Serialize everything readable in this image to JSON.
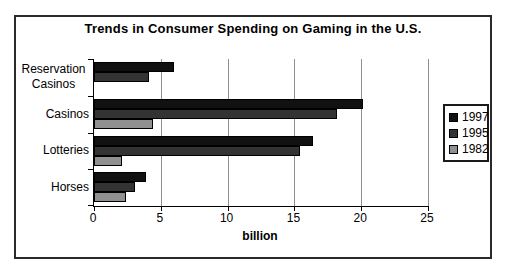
{
  "chart_data": {
    "type": "bar",
    "orientation": "horizontal",
    "title": "Trends in Consumer Spending on Gaming in the U.S.",
    "xlabel": "billion",
    "xlim": [
      0,
      25
    ],
    "xticks": [
      0,
      5,
      10,
      15,
      20,
      25
    ],
    "grid": true,
    "legend_position": "right",
    "categories": [
      "Reservation Casinos",
      "Casinos",
      "Lotteries",
      "Horses"
    ],
    "series": [
      {
        "name": "1997",
        "color": "#111111",
        "values": [
          6.0,
          20.1,
          16.4,
          3.9
        ]
      },
      {
        "name": "1995",
        "color": "#333333",
        "values": [
          4.1,
          18.2,
          15.4,
          3.1
        ]
      },
      {
        "name": "1982",
        "color": "#909090",
        "values": [
          0,
          4.4,
          2.1,
          2.4
        ]
      }
    ]
  },
  "colors": {
    "frame_border": "#2a2a2a",
    "gridline": "#8f8f8f",
    "axis": "#000000",
    "background": "#ffffff"
  }
}
